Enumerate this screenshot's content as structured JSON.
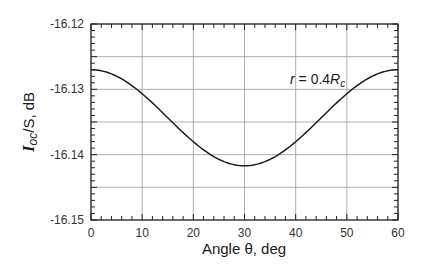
{
  "chart_data": {
    "type": "line",
    "title": "",
    "xlabel": "Angle θ, deg",
    "ylabel_main": "I",
    "ylabel_sub": "oc",
    "ylabel_rest": "/S, dB",
    "xlim": [
      0,
      60
    ],
    "ylim": [
      -16.15,
      -16.12
    ],
    "xticks": [
      0,
      10,
      20,
      30,
      40,
      50,
      60
    ],
    "xtick_labels": [
      "0",
      "10",
      "20",
      "30",
      "40",
      "50",
      "60"
    ],
    "yticks": [
      -16.15,
      -16.14,
      -16.13,
      -16.12
    ],
    "ytick_labels": [
      "-16.15",
      "-16.14",
      "-16.13",
      "-16.12"
    ],
    "grid": true,
    "annotation": {
      "prefix": "r",
      "mid": " = 0.4",
      "var": "R",
      "sub": "c"
    },
    "series": [
      {
        "name": "r = 0.4Rc",
        "x": [
          0,
          5,
          10,
          15,
          20,
          25,
          30,
          35,
          40,
          45,
          50,
          55,
          60
        ],
        "values": [
          -16.127,
          -16.128,
          -16.1307,
          -16.1343,
          -16.138,
          -16.1407,
          -16.1417,
          -16.1407,
          -16.138,
          -16.1343,
          -16.1307,
          -16.128,
          -16.127
        ]
      }
    ]
  }
}
